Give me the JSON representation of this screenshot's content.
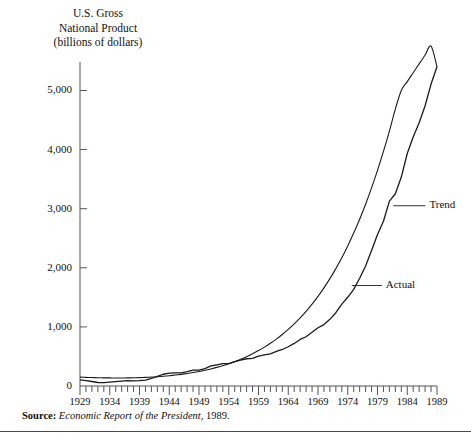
{
  "figure": {
    "axis_title": "U.S. Gross\nNational Product\n(billions of dollars)",
    "source_prefix": "Source:",
    "source_italic": "Economic Report of the President",
    "source_suffix": ", 1989.",
    "line_color": "#1a1a1a",
    "axis_color": "#555555",
    "rule_color": "#4a4a4a"
  },
  "labels": {
    "trend": "Trend",
    "actual": "Actual"
  },
  "chart_data": {
    "type": "line",
    "title": "U.S. Gross National Product (billions of dollars)",
    "xlabel": "",
    "ylabel": "U.S. Gross National Product (billions of dollars)",
    "xlim": [
      1929,
      1989
    ],
    "ylim": [
      0,
      5600
    ],
    "grid": false,
    "legend": "inline-annotations",
    "ytick_values": [
      0,
      1000,
      2000,
      3000,
      4000,
      5000
    ],
    "ytick_labels": [
      "0",
      "1,000",
      "2,000",
      "3,000",
      "4,000",
      "5,000"
    ],
    "xtick_values": [
      1929,
      1934,
      1939,
      1944,
      1949,
      1954,
      1959,
      1964,
      1969,
      1974,
      1979,
      1984,
      1989
    ],
    "xtick_labels": [
      "1929",
      "1934",
      "1939",
      "1944",
      "1949",
      "1954",
      "1959",
      "1964",
      "1969",
      "1974",
      "1979",
      "1984",
      "1989"
    ],
    "minor_xticks_every": 1,
    "x": [
      1929,
      1930,
      1931,
      1932,
      1933,
      1934,
      1935,
      1936,
      1937,
      1938,
      1939,
      1940,
      1941,
      1942,
      1943,
      1944,
      1945,
      1946,
      1947,
      1948,
      1949,
      1950,
      1951,
      1952,
      1953,
      1954,
      1955,
      1956,
      1957,
      1958,
      1959,
      1960,
      1961,
      1962,
      1963,
      1964,
      1965,
      1966,
      1967,
      1968,
      1969,
      1970,
      1971,
      1972,
      1973,
      1974,
      1975,
      1976,
      1977,
      1978,
      1979,
      1980,
      1981,
      1982,
      1983,
      1984,
      1985,
      1986,
      1987,
      1988,
      1989
    ],
    "series": [
      {
        "name": "Actual",
        "values": [
          104,
          91,
          76,
          59,
          56,
          65,
          73,
          83,
          91,
          86,
          92,
          101,
          127,
          162,
          199,
          219,
          223,
          222,
          244,
          270,
          267,
          294,
          339,
          358,
          379,
          380,
          414,
          438,
          461,
          467,
          507,
          527,
          545,
          586,
          618,
          664,
          720,
          788,
          833,
          910,
          985,
          1039,
          1128,
          1240,
          1386,
          1501,
          1635,
          1824,
          2030,
          2294,
          2563,
          2788,
          3127,
          3253,
          3535,
          3933,
          4213,
          4453,
          4742,
          5108,
          5400
        ]
      },
      {
        "name": "Trend",
        "values": [
          150,
          146,
          143,
          140,
          138,
          137,
          136,
          136,
          137,
          139,
          142,
          146,
          151,
          157,
          165,
          174,
          185,
          197,
          211,
          227,
          245,
          266,
          289,
          315,
          344,
          376,
          412,
          452,
          496,
          545,
          599,
          658,
          723,
          794,
          872,
          957,
          1050,
          1152,
          1263,
          1384,
          1516,
          1660,
          1816,
          1986,
          2170,
          2370,
          2587,
          2822,
          3076,
          3351,
          3648,
          3968,
          4313,
          4685,
          5000,
          5150,
          5300,
          5450,
          5600,
          5750,
          5400
        ]
      }
    ],
    "annotations": [
      {
        "text": "Trend",
        "near_year": 1981,
        "near_value": 3050
      },
      {
        "text": "Actual",
        "near_year": 1974,
        "near_value": 1700
      }
    ]
  }
}
